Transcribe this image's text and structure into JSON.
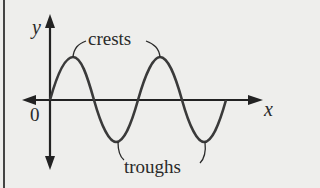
{
  "diagram": {
    "labels": {
      "y_axis": "y",
      "x_axis": "x",
      "origin": "0",
      "crests": "crests",
      "troughs": "troughs"
    },
    "colors": {
      "background": "#eeeeec",
      "ink": "#2a2a2a",
      "wave": "#3a3a3a"
    },
    "wave": {
      "cycles": 2,
      "crest_count": 2,
      "trough_count": 2
    }
  }
}
